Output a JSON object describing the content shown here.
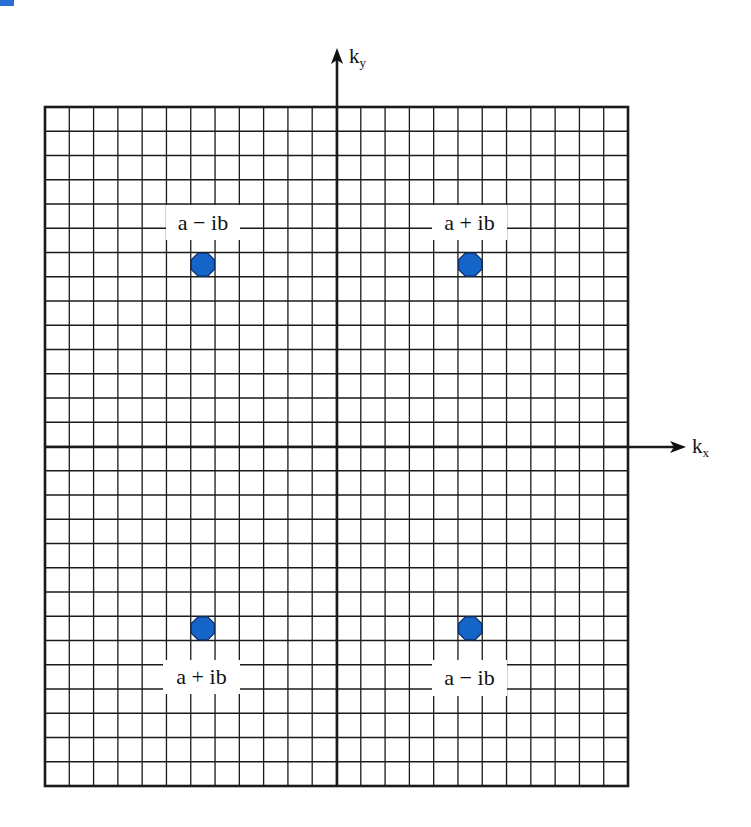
{
  "figure": {
    "type": "complex k-plane diagram",
    "corner_mark_color": "#2a6fd6",
    "grid": {
      "left": 45,
      "top": 107,
      "right": 628,
      "bottom": 786,
      "columns": 24,
      "rows": 28,
      "line_color": "#1a1a1a"
    },
    "axes": {
      "x": {
        "label": "k",
        "subscript": "x",
        "y": 447,
        "x_start": 45,
        "arrow_tip_x": 686
      },
      "y": {
        "label": "k",
        "subscript": "y",
        "x": 337,
        "y_start": 786,
        "arrow_tip_y": 48
      }
    },
    "points": [
      {
        "quadrant": "upper-left",
        "label": "a − ib",
        "col": 6,
        "row": 6,
        "label_box": {
          "x": 166,
          "y": 205,
          "w": 74,
          "h": 35
        }
      },
      {
        "quadrant": "upper-right",
        "label": "a + ib",
        "col": 17,
        "row": 6,
        "label_box": {
          "x": 432,
          "y": 205,
          "w": 75,
          "h": 35
        }
      },
      {
        "quadrant": "lower-left",
        "label": "a + ib",
        "col": 6,
        "row": 21,
        "label_box": {
          "x": 163,
          "y": 660,
          "w": 77,
          "h": 34
        }
      },
      {
        "quadrant": "lower-right",
        "label": "a − ib",
        "col": 17,
        "row": 21,
        "label_box": {
          "x": 432,
          "y": 660,
          "w": 75,
          "h": 36
        }
      }
    ],
    "point_style": {
      "fill": "#1565c8",
      "stroke": "#0d2f66",
      "shape": "octagon"
    }
  }
}
